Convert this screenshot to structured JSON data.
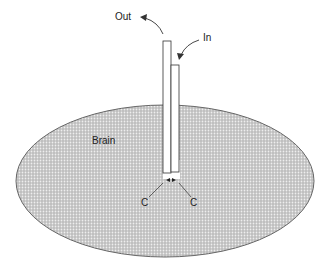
{
  "labels": {
    "out": "Out",
    "in": "In",
    "brain": "Brain",
    "c_left": "C",
    "c_right": "C"
  },
  "colors": {
    "tissue_fill": "#c8c8c8",
    "tissue_dots": "#ffffff",
    "outline": "#555555",
    "probe": "#ffffff",
    "text": "#222222"
  }
}
